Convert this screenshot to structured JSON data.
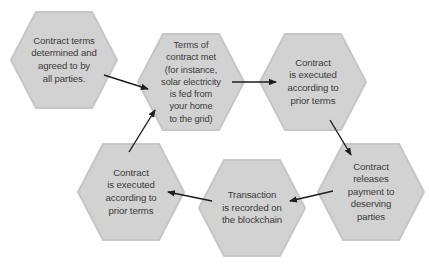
{
  "diagram": {
    "type": "cycle-flow",
    "colors": {
      "hex_fill": "#d2d2d2",
      "hex_edge": "#c4c4c4",
      "text": "#3a3a3a",
      "arrow": "#1e1e1e",
      "background": "#ffffff"
    },
    "nodes": [
      {
        "id": "n1",
        "label": "Contract terms\ndetermined and\nagreed to by\nall parties."
      },
      {
        "id": "n2",
        "label": "Terms of\ncontract met\n(for instance,\nsolar electricity\nis fed from\nyour home\nto the grid)"
      },
      {
        "id": "n3",
        "label": "Contract\nis executed\naccording to\nprior terms"
      },
      {
        "id": "n4",
        "label": "Contract\nreleases\npayment to\ndeserving\nparties"
      },
      {
        "id": "n5",
        "label": "Transaction\nis recorded on\nthe blockchain"
      },
      {
        "id": "n6",
        "label": "Contract\nis executed\naccording to\nprior terms"
      }
    ],
    "edges": [
      {
        "from": "n1",
        "to": "n2"
      },
      {
        "from": "n2",
        "to": "n3"
      },
      {
        "from": "n3",
        "to": "n4"
      },
      {
        "from": "n4",
        "to": "n5"
      },
      {
        "from": "n5",
        "to": "n6"
      },
      {
        "from": "n6",
        "to": "n2"
      }
    ]
  }
}
